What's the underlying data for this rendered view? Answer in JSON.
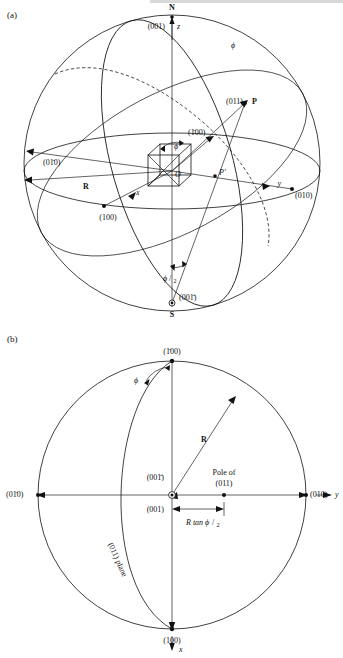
{
  "figure": {
    "panels": [
      {
        "id": "a",
        "label": "(a)",
        "description": "Sphere of projection with cubic unit cell at centre",
        "labels": {
          "north_pole": "N",
          "south_pole": "S",
          "north_index": "(001)",
          "south_index": "(001̄)",
          "z_axis": "z",
          "x_axis": "x",
          "y_axis": "y",
          "origin": "O",
          "point_p": "P",
          "point_p_prime": "P′",
          "pole_011": "(011)",
          "index_100_bar": "(1̄00)",
          "index_100": "(100)",
          "index_010": "(010)",
          "index_010_bar": "(01̄0)",
          "radius": "R",
          "phi": "ϕ",
          "phi_half_num": "ϕ",
          "phi_half_den": "2",
          "phi_center": "ϕ"
        }
      },
      {
        "id": "b",
        "label": "(b)",
        "description": "Stereographic projection showing pole of (011) at R tan ϕ/2",
        "labels": {
          "top_index": "(1̄00)",
          "bottom_index": "(100)",
          "left_index": "(01̄0)",
          "right_index": "(010)",
          "center_index_upper": "(001̄)",
          "center_index_lower": "(001)",
          "x_axis": "x",
          "y_axis": "y",
          "radius": "R",
          "phi": "ϕ",
          "pole_of_line1": "Pole of",
          "pole_of_line2": "(011)",
          "distance_label": "R tan ϕ",
          "distance_den": "2",
          "plane_label": "(011) plane"
        }
      }
    ]
  },
  "colors": {
    "ink": "#111111",
    "background": "#ffffff"
  }
}
